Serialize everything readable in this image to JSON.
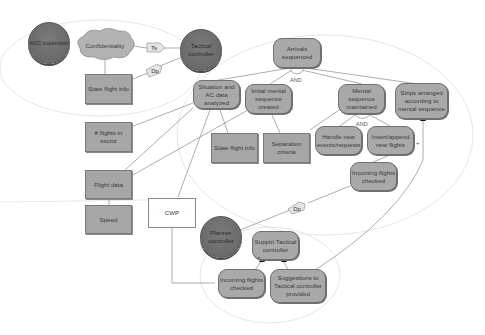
{
  "diagram": {
    "type": "goal-model",
    "actors": {
      "acc_supervisor": "ACC supervisor",
      "tactical_controller": "Tactical controller",
      "planner_controller": "Planner controller"
    },
    "softgoal": {
      "confidentiality": "Confidentiality"
    },
    "goals": {
      "arrivals_sequenced": "Arrivals sequenced",
      "situation_analyzed": "Situation and AC data analyzed",
      "initial_sequence": "Initial mental sequence created",
      "mental_sequence_maintained": "Mental sequence maintained",
      "strips_arranged": "Strips arranged according to mental sequence",
      "handle_events": "Handle new events/requests",
      "insert_flights": "Insert/append new flights",
      "incoming_checked_tc": "Incoming flights checked",
      "support_tc": "Suppirt Tactical controller",
      "incoming_checked_pc": "Incoming flights checked",
      "suggestions": "Suggestions to Tactical controller provided"
    },
    "resources": {
      "state_flight_info_top": "State flight info",
      "flights_in_sector": "# flights in sector",
      "state_flight_info_mid": "State flight info",
      "separation_criteria": "Separation criteria",
      "flight_data": "Flight data",
      "speed": "Speed",
      "cwp": "CWP"
    },
    "dependency_tags": {
      "ts": "Ts",
      "dp1": "Dp",
      "dp2": "Dp"
    },
    "decomposition_labels": {
      "and1": "AND",
      "and2": "AND"
    },
    "contribution_labels": {
      "plus1": "+",
      "plus2": "+"
    }
  }
}
